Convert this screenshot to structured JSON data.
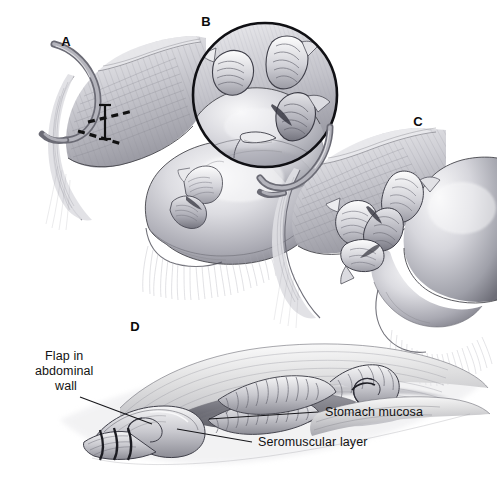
{
  "figure": {
    "style": "grayscale medical line-and-tone illustration",
    "background_color": "#ffffff",
    "ink_color": "#131313",
    "panel_count": 4
  },
  "panels": [
    {
      "id": "A",
      "letter": "A",
      "letter_pos": [
        66,
        46
      ],
      "caption": "Abdominal wall with planned flap incision outlined; stomach with seromuscular flaps raised"
    },
    {
      "id": "B",
      "letter": "B",
      "letter_pos": [
        206,
        26
      ],
      "caption": "Circular magnified inset of the seromuscular flaps on the stomach"
    },
    {
      "id": "C",
      "letter": "C",
      "letter_pos": [
        418,
        126
      ],
      "caption": "Stomach approximated to the abdominal wall, flaps interdigitated"
    },
    {
      "id": "D",
      "letter": "D",
      "letter_pos": [
        135,
        331
      ],
      "caption": "Cross-sectional view of completed flap valve mechanism"
    }
  ],
  "annotations": [
    {
      "name": "flap-in-abdominal-wall",
      "lines": [
        "Flap in",
        "abdominal",
        "wall"
      ],
      "text_anchor": "middle",
      "text_x": 66,
      "text_y": 360,
      "line_height": 15,
      "leader": "M 80 397 L 152 424"
    },
    {
      "name": "stomach-mucosa",
      "lines": [
        "Stomach mucosa"
      ],
      "text_anchor": "start",
      "text_x": 325,
      "text_y": 416,
      "line_height": 15,
      "leader": "M 318 412 L 209 419"
    },
    {
      "name": "seromuscular-layer",
      "lines": [
        "Seromuscular layer"
      ],
      "text_anchor": "start",
      "text_x": 258,
      "text_y": 446,
      "line_height": 15,
      "leader": "M 252 442 L 177 429"
    }
  ],
  "incision_marks": {
    "name": "dashed-incision-outline",
    "description": "Dashed incision lines with solid height bar marking the abdominal wall flap in panel A",
    "upper_dashes": "M 88 122 L 133 111",
    "lower_dashes": "M 78 131 L 122 144",
    "bar": "M 105 105 L 105 139"
  },
  "colors": {
    "paper": "#ffffff",
    "ink": "#131313",
    "tissue_light": "#e9e9ec",
    "tissue_mid": "#b9b9c0",
    "tissue_dark": "#85858e",
    "shadow": "#5d5d66",
    "serosa_highlight": "#f4f4f6"
  }
}
